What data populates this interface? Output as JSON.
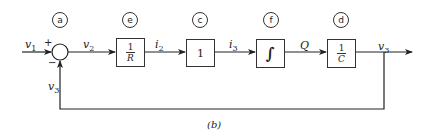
{
  "diagram": {
    "caption": "(b)",
    "summing_junction": {
      "tag": "a",
      "plus_sign": "+",
      "minus_sign": "−"
    },
    "blocks": [
      {
        "tag": "e",
        "num": "1",
        "den": "R"
      },
      {
        "tag": "c",
        "value": "1"
      },
      {
        "tag": "f",
        "value": "∫"
      },
      {
        "tag": "d",
        "num": "1",
        "den": "C"
      }
    ],
    "signals": {
      "v1": {
        "base": "v",
        "sub": "1"
      },
      "v2": {
        "base": "v",
        "sub": "2"
      },
      "i2": {
        "base": "i",
        "sub": "2"
      },
      "i3": {
        "base": "i",
        "sub": "3"
      },
      "Q": {
        "base": "Q",
        "sub": ""
      },
      "v3_out": {
        "base": "v",
        "sub": "3"
      },
      "v3_feedback": {
        "base": "v",
        "sub": "3"
      }
    }
  }
}
